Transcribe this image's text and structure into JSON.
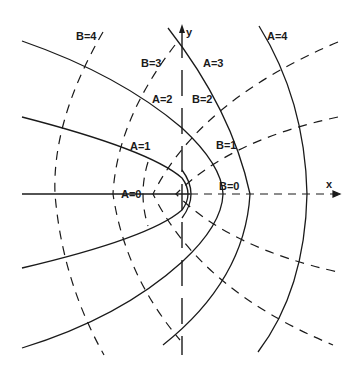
{
  "diagram": {
    "type": "parabolic-coordinates",
    "axes": {
      "x_label": "x",
      "y_label": "y"
    },
    "solid_curves": [
      {
        "label": "A=0"
      },
      {
        "label": "A=1"
      },
      {
        "label": "A=2"
      },
      {
        "label": "A=3"
      },
      {
        "label": "A=4"
      }
    ],
    "dashed_curves": [
      {
        "label": "B=0"
      },
      {
        "label": "B=1"
      },
      {
        "label": "B=2"
      },
      {
        "label": "B=3"
      },
      {
        "label": "B=4"
      }
    ],
    "colors": {
      "ink": "#1a1a1a",
      "background": "#ffffff"
    }
  }
}
